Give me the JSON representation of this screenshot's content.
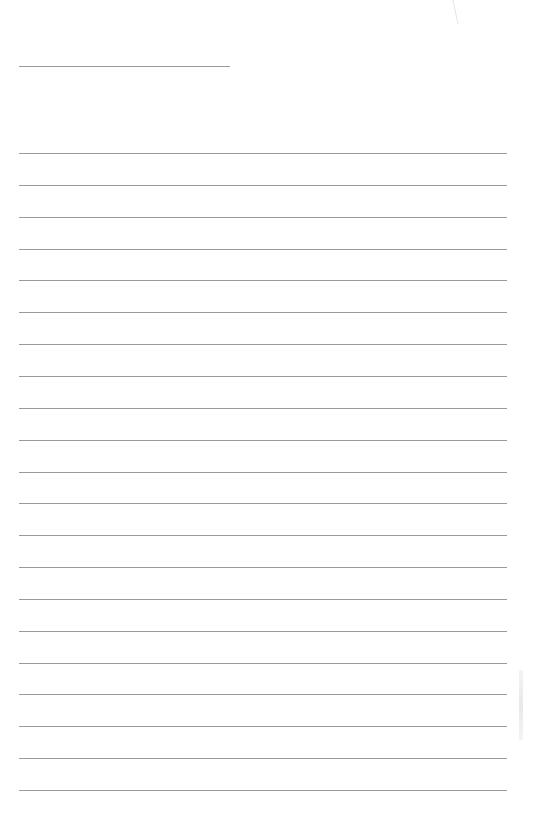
{
  "page": {
    "type": "blank lined sheet",
    "header_line": {
      "top": 66,
      "left": 19,
      "width": 211
    },
    "ruled_lines": {
      "count": 21,
      "first_top": 153,
      "spacing": 31.85,
      "left": 19,
      "width": 488
    },
    "line_color": "#9a9a9a",
    "background": "#ffffff"
  }
}
